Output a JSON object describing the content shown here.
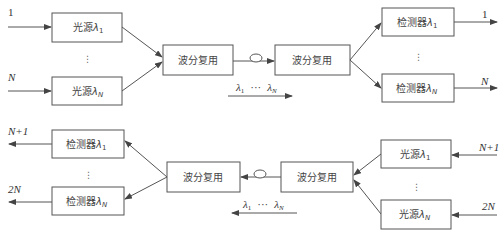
{
  "diagram": {
    "type": "wdm-bidirectional-link",
    "colors": {
      "stroke": "#555555",
      "text": "#444444",
      "background": "#ffffff"
    },
    "top": {
      "inputs": [
        {
          "label": "1",
          "italic": false
        },
        {
          "label": "N",
          "italic": true
        }
      ],
      "sources": [
        {
          "name": "光源",
          "lambda": "λ",
          "sub": "1"
        },
        {
          "name": "光源",
          "lambda": "λ",
          "sub": "N"
        }
      ],
      "mux_left": "波分复用",
      "mux_right": "波分复用",
      "detectors": [
        {
          "name": "检测器",
          "lambda": "λ",
          "sub": "1"
        },
        {
          "name": "检测器",
          "lambda": "λ",
          "sub": "N"
        }
      ],
      "outputs": [
        {
          "label": "1",
          "italic": false
        },
        {
          "label": "N",
          "italic": true
        }
      ],
      "wavelengths": {
        "first": "λ",
        "first_sub": "1",
        "ellipsis": "···",
        "last": "λ",
        "last_sub": "N",
        "direction": "right"
      },
      "vdots": "⋮"
    },
    "bottom": {
      "outputs": [
        {
          "label": "N+1"
        },
        {
          "label": "2N"
        }
      ],
      "detectors": [
        {
          "name": "检测器",
          "lambda": "λ",
          "sub": "1"
        },
        {
          "name": "检测器",
          "lambda": "λ",
          "sub": "N"
        }
      ],
      "mux_left": "波分复用",
      "mux_right": "波分复用",
      "sources": [
        {
          "name": "光源",
          "lambda": "λ",
          "sub": "1"
        },
        {
          "name": "光源",
          "lambda": "λ",
          "sub": "N"
        }
      ],
      "inputs": [
        {
          "label": "N+1"
        },
        {
          "label": "2N"
        }
      ],
      "wavelengths": {
        "first": "λ",
        "first_sub": "1",
        "ellipsis": "···",
        "last": "λ",
        "last_sub": "N",
        "direction": "left"
      },
      "vdots": "⋮"
    }
  }
}
